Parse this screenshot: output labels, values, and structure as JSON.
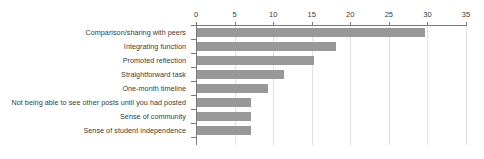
{
  "chart_data": {
    "type": "bar",
    "orientation": "horizontal",
    "title": "",
    "xlabel": "",
    "ylabel": "",
    "categories": [
      "Comparison/sharing with peers",
      "Integrating function",
      "Promoted reflection",
      "Straightforward task",
      "One-month timeline",
      "Not being able to see other posts until you had posted",
      "Sense of community",
      "Sense of student independence"
    ],
    "values": [
      29.5,
      18,
      15.2,
      11.3,
      9.2,
      7,
      7,
      7
    ],
    "xlim": [
      0,
      35
    ],
    "xticks": [
      0,
      5,
      10,
      15,
      20,
      25,
      30,
      35
    ],
    "xtick_labels": [
      "0",
      "5",
      "10",
      "15",
      "20",
      "25",
      "30",
      "35"
    ],
    "grid": true,
    "legend": false,
    "bar_color": "#989898",
    "axis_color": "#7b7b7b",
    "grid_color": "#e2e2e2",
    "text_color": "#3a3a3a"
  }
}
